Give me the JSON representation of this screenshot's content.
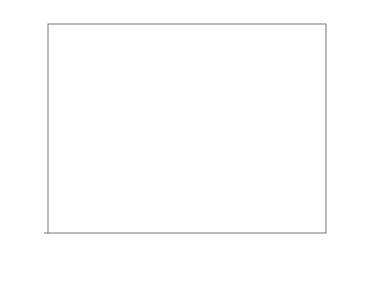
{
  "chart_data": {
    "type": "bar",
    "title": "",
    "categories": [
      "生牛肉",
      "对照组",
      "0.015%提取物",
      "0.030%提取物",
      "0.045%提取物"
    ],
    "series": [
      {
        "name": "肌酸",
        "axis": "left",
        "color": "#d9d9d9",
        "values": [
          4.25,
          1.97,
          2.25,
          2.34,
          2.65
        ],
        "errors": [
          0.1,
          0.12,
          0.2,
          0.07,
          0.35
        ],
        "significance": [
          "a",
          "c",
          "c",
          "bc",
          "b"
        ]
      },
      {
        "name": "葡萄糖",
        "axis": "right",
        "color": "#ffffff",
        "values": [
          3.8,
          2.37,
          2.18,
          2.15,
          2.7
        ],
        "errors": [
          0.17,
          0.05,
          0.2,
          0.08,
          0.03
        ],
        "significance": [
          "A",
          "BC",
          "C",
          "C",
          "B"
        ]
      }
    ],
    "ylabel": "肌酸含量/（mg/g）",
    "y2label": "葡萄糖含量/（mg/g）",
    "xlabel": "",
    "ylim": [
      0,
      5
    ],
    "y2lim": [
      0,
      5
    ],
    "yticks": [
      0,
      1,
      2,
      3,
      4,
      5
    ],
    "grid": false,
    "legend_position": "upper right"
  }
}
